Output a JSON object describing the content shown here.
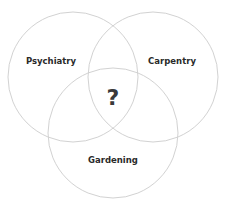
{
  "diagram": {
    "type": "venn",
    "sets": [
      {
        "label": "Psychiatry"
      },
      {
        "label": "Carpentry"
      },
      {
        "label": "Gardening"
      }
    ],
    "intersection_label": "?",
    "colors": {
      "circle_stroke": "#d2d2d2",
      "text": "#2a2a2a",
      "background": "#ffffff"
    }
  }
}
